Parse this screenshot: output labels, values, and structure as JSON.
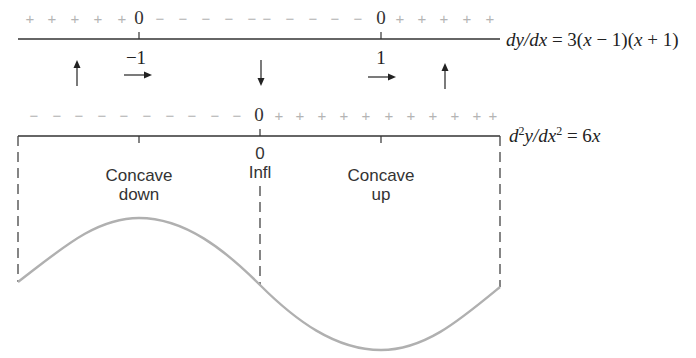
{
  "first_derivative": {
    "formula_label": "dy/dx = 3(x − 1)(x + 1)",
    "formula_parts": {
      "lhs": "dy/dx",
      "eq": " = 3(",
      "x1": "x",
      "m1": " − 1)(",
      "x2": "x",
      "m2": " + 1)"
    },
    "sign_row": {
      "left": [
        "+",
        "+",
        "+",
        "+",
        "+"
      ],
      "zero_left": "0",
      "middle": [
        "−",
        "−",
        "−",
        "−",
        "−",
        "−",
        "−",
        "−",
        "−",
        "−"
      ],
      "zero_right": "0",
      "right": [
        "+",
        "+",
        "+",
        "+",
        "+"
      ]
    },
    "critical_points": [
      "−1",
      "1"
    ],
    "arrows": [
      {
        "direction": "up",
        "meaning": "increasing"
      },
      {
        "direction": "right",
        "at": "−1"
      },
      {
        "direction": "down",
        "meaning": "decreasing"
      },
      {
        "direction": "right",
        "at": "1"
      },
      {
        "direction": "up",
        "meaning": "increasing"
      }
    ]
  },
  "second_derivative": {
    "formula_parts": {
      "d": "d",
      "sup1": "2",
      "y": "y/",
      "dx": "dx",
      "sup2": "2",
      "rhs": " = 6",
      "x": "x"
    },
    "formula_label": "d²y/dx² = 6x",
    "sign_row": {
      "left": [
        "−",
        "−",
        "−",
        "−",
        "−",
        "−",
        "−",
        "−",
        "−",
        "−"
      ],
      "zero": "0",
      "right": [
        "+",
        "+",
        "+",
        "+",
        "+",
        "+",
        "+",
        "+",
        "+",
        "+",
        "+"
      ]
    },
    "inflection_value": "0",
    "inflection_label": "Infl",
    "regions": [
      {
        "line1": "Concave",
        "line2": "down"
      },
      {
        "line1": "Concave",
        "line2": "up"
      }
    ]
  },
  "colors": {
    "axis": "#333333",
    "sign": "#b4b4b4",
    "curve": "#b0b0b0",
    "text": "#222222"
  }
}
